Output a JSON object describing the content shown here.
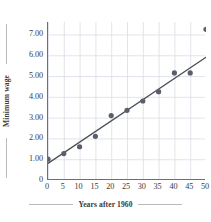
{
  "chart_data": {
    "type": "scatter",
    "title": "",
    "xlabel": "Years after 1960",
    "ylabel": "Minimum wage",
    "xlim": [
      0,
      50
    ],
    "ylim": [
      0,
      7.6
    ],
    "xticks": [
      "0",
      "5",
      "10",
      "15",
      "20",
      "25",
      "30",
      "35",
      "40",
      "45",
      "50"
    ],
    "xtick_values": [
      0,
      5,
      10,
      15,
      20,
      25,
      30,
      35,
      40,
      45,
      50
    ],
    "yticks": [
      "0",
      "1.00",
      "2.00",
      "3.00",
      "4.00",
      "5.00",
      "6.00",
      "7.00"
    ],
    "ytick_values": [
      0,
      1,
      2,
      3,
      4,
      5,
      6,
      7
    ],
    "grid": true,
    "legend": "none",
    "x": [
      0,
      5,
      10,
      15,
      20,
      25,
      30,
      35,
      40,
      45,
      50
    ],
    "y": [
      1.0,
      1.27,
      1.6,
      2.1,
      3.1,
      3.35,
      3.8,
      4.25,
      5.15,
      5.15,
      7.25
    ],
    "points": [
      {
        "x": 0,
        "y": 1.0
      },
      {
        "x": 5,
        "y": 1.27
      },
      {
        "x": 10,
        "y": 1.6
      },
      {
        "x": 15,
        "y": 2.1
      },
      {
        "x": 20,
        "y": 3.1
      },
      {
        "x": 25,
        "y": 3.35
      },
      {
        "x": 30,
        "y": 3.8
      },
      {
        "x": 35,
        "y": 4.25
      },
      {
        "x": 40,
        "y": 5.15
      },
      {
        "x": 45,
        "y": 5.15
      },
      {
        "x": 50,
        "y": 7.25
      }
    ],
    "trendline": {
      "x0": 0,
      "y0": 0.8,
      "x1": 50,
      "y1": 5.9
    },
    "colors": {
      "marker": "#5a5f6b",
      "line": "#4c5159",
      "grid": "#d9dde4",
      "axis": "#6f6f6f",
      "text": "#3a3a3a",
      "background": "#ffffff"
    },
    "marker_size": 2.6
  }
}
